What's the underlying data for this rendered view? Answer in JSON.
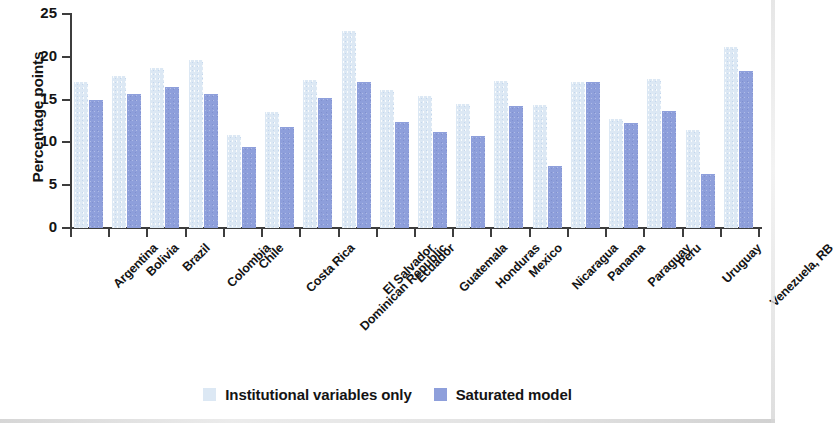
{
  "chart_data": {
    "type": "bar",
    "title": "",
    "xlabel": "",
    "ylabel": "Percentage points",
    "ylim": [
      0,
      25
    ],
    "yticks": [
      0,
      5,
      10,
      15,
      20,
      25
    ],
    "grid": false,
    "legend_position": "bottom-center",
    "orientation": "vertical",
    "group_mode": "grouped",
    "categories": [
      "Argentina",
      "Bolivia",
      "Brazil",
      "Colombia",
      "Chile",
      "Costa Rica",
      "Dominican Republic",
      "El Salvador",
      "Ecuador",
      "Guatemala",
      "Honduras",
      "Mexico",
      "Nicaragua",
      "Panama",
      "Paraguay",
      "Peru",
      "Uruguay",
      "Venezuela, RB"
    ],
    "series": [
      {
        "name": "Institutional variables only",
        "color": "#dce8f4",
        "values": [
          17.0,
          17.8,
          18.7,
          19.6,
          10.9,
          13.5,
          17.3,
          23.0,
          16.1,
          15.4,
          14.5,
          17.2,
          14.4,
          17.1,
          12.7,
          17.4,
          11.5,
          21.2
        ]
      },
      {
        "name": "Saturated model",
        "color": "#8e9fdb",
        "values": [
          14.9,
          15.6,
          16.5,
          15.6,
          9.5,
          11.8,
          15.2,
          17.1,
          12.4,
          11.2,
          10.8,
          14.3,
          7.3,
          17.0,
          12.3,
          13.7,
          6.3,
          18.4
        ]
      }
    ]
  },
  "axis": {
    "y_title": "Percentage points",
    "y_tick_labels": [
      "0",
      "5",
      "10",
      "15",
      "20",
      "25"
    ]
  },
  "legend": {
    "items": [
      {
        "label": "Institutional variables only",
        "swatch": "light-blue-swatch"
      },
      {
        "label": "Saturated model",
        "swatch": "periwinkle-swatch"
      }
    ]
  },
  "colors": {
    "series_light": "#dce8f4",
    "series_dark": "#8e9fdb",
    "axis": "#3d3d3d",
    "text": "#141414",
    "background": "#ffffff"
  }
}
